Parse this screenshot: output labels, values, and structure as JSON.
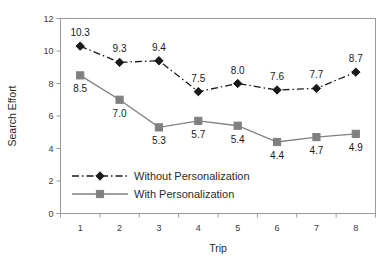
{
  "chart_data": {
    "type": "line",
    "title": "",
    "xlabel": "Trip",
    "ylabel": "Search Effort",
    "categories": [
      "1",
      "2",
      "3",
      "4",
      "5",
      "6",
      "7",
      "8"
    ],
    "ylim": [
      0,
      12
    ],
    "yticks": [
      "0",
      "2",
      "4",
      "6",
      "8",
      "10",
      "12"
    ],
    "grid": false,
    "legend_position": "inside-bottom-left",
    "series": [
      {
        "name": "Without Personalization",
        "values": [
          10.3,
          9.3,
          9.4,
          7.5,
          8.0,
          7.6,
          7.7,
          8.7
        ],
        "labels": [
          "10.3",
          "9.3",
          "9.4",
          "7.5",
          "8.0",
          "7.6",
          "7.7",
          "8.7"
        ],
        "color": "#1a1a1a",
        "marker": "diamond",
        "linestyle": "dashdot",
        "label_position": "above"
      },
      {
        "name": "With Personalization",
        "values": [
          8.5,
          7.0,
          5.3,
          5.7,
          5.4,
          4.4,
          4.7,
          4.9
        ],
        "labels": [
          "8.5",
          "7.0",
          "5.3",
          "5.7",
          "5.4",
          "4.4",
          "4.7",
          "4.9"
        ],
        "color": "#808080",
        "marker": "square",
        "linestyle": "solid",
        "label_position": "below"
      }
    ]
  }
}
